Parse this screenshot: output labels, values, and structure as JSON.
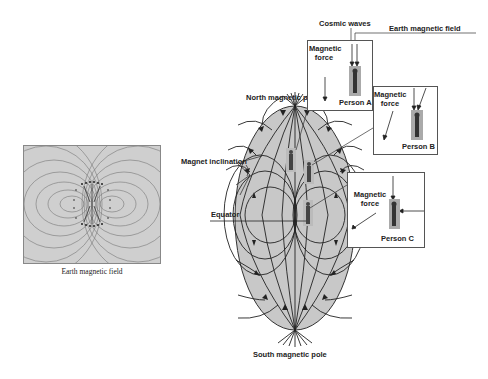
{
  "left_figure": {
    "caption": "Earth magnetic field"
  },
  "main_figure": {
    "labels": {
      "cosmic_waves": "Cosmic waves",
      "earth_magnetic_field": "Earth magnetic field",
      "north_pole": "North magnetic pole",
      "south_pole": "South magnetic pole",
      "magnet_inclination": "Magnet inclination",
      "equator": "Equator"
    },
    "boxes": [
      {
        "force_label_1": "Magnetic",
        "force_label_2": "force",
        "person": "Person A"
      },
      {
        "force_label_1": "Magnetic",
        "force_label_2": "force",
        "person": "Person B"
      },
      {
        "force_label_1": "Magnetic",
        "force_label_2": "force",
        "person": "Person C"
      }
    ]
  },
  "colors": {
    "earth_fill": "#c8c8c8",
    "panel_fill": "#d0d0d0",
    "line": "#222222",
    "person": "#444444"
  }
}
